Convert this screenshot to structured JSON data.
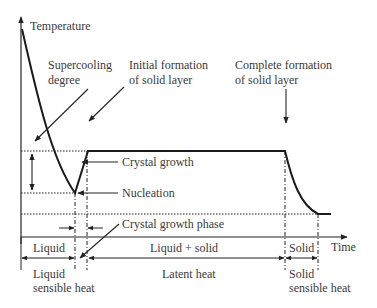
{
  "axes": {
    "y_label": "Temperature",
    "x_label": "Time"
  },
  "annotations": {
    "supercooling_line1": "Supercooling",
    "supercooling_line2": "degree",
    "initial_line1": "Initial formation",
    "initial_line2": "of solid layer",
    "complete_line1": "Complete formation",
    "complete_line2": "of solid layer",
    "crystal_growth": "Crystal growth",
    "nucleation": "Nucleation",
    "crystal_growth_phase": "Crystal growth phase"
  },
  "phases": {
    "liquid": "Liquid",
    "liquid_solid": "Liquid + solid",
    "solid": "Solid"
  },
  "heat": {
    "liquid_line1": "Liquid",
    "liquid_line2": "sensible heat",
    "latent": "Latent heat",
    "solid_line1": "Solid",
    "solid_line2": "sensible heat"
  },
  "colors": {
    "line": "#222222",
    "text": "#3a3a3a",
    "background": "#ffffff"
  }
}
